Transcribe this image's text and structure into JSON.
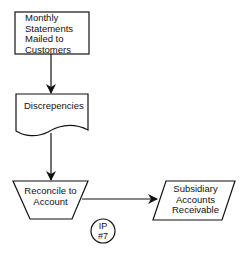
{
  "diagram": {
    "type": "flowchart",
    "nodes": [
      {
        "id": "n1",
        "shape": "process",
        "label_lines": [
          "Monthly",
          "Statements",
          "Mailed to",
          "Customers"
        ]
      },
      {
        "id": "n2",
        "shape": "document",
        "label": "Discrepencies"
      },
      {
        "id": "n3",
        "shape": "manual-operation",
        "label_lines": [
          "Reconcile to",
          "Account"
        ]
      },
      {
        "id": "n4",
        "shape": "data",
        "label_lines": [
          "Subsidiary",
          "Accounts",
          "Receivable"
        ]
      },
      {
        "id": "n5",
        "shape": "connector",
        "label_lines": [
          "IP",
          "#7"
        ]
      }
    ],
    "edges": [
      {
        "from": "n1",
        "to": "n2"
      },
      {
        "from": "n2",
        "to": "n3"
      },
      {
        "from": "n3",
        "to": "n4"
      }
    ],
    "colors": {
      "stroke": "#111111",
      "fill": "#ffffff",
      "text": "#111111"
    }
  }
}
